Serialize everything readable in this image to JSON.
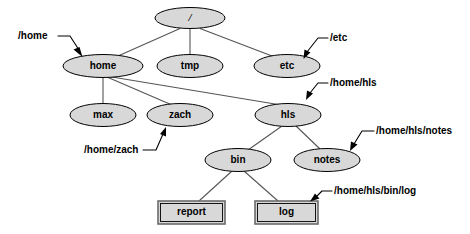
{
  "diagram": {
    "type": "filesystem-tree",
    "nodes": [
      {
        "id": "root",
        "label": "/",
        "shape": "ellipse",
        "cx": 190,
        "cy": 18,
        "rx": 35,
        "ry": 10.5
      },
      {
        "id": "home",
        "label": "home",
        "shape": "ellipse",
        "cx": 103,
        "cy": 66,
        "rx": 40,
        "ry": 11.5
      },
      {
        "id": "tmp",
        "label": "tmp",
        "shape": "ellipse",
        "cx": 190,
        "cy": 66,
        "rx": 33,
        "ry": 11.5
      },
      {
        "id": "etc",
        "label": "etc",
        "shape": "ellipse",
        "cx": 287,
        "cy": 66,
        "rx": 33,
        "ry": 11.5
      },
      {
        "id": "max",
        "label": "max",
        "shape": "ellipse",
        "cx": 103,
        "cy": 115,
        "rx": 33,
        "ry": 11.5
      },
      {
        "id": "zach",
        "label": "zach",
        "shape": "ellipse",
        "cx": 180,
        "cy": 115,
        "rx": 33,
        "ry": 11.5
      },
      {
        "id": "hls",
        "label": "hls",
        "shape": "ellipse",
        "cx": 288,
        "cy": 115,
        "rx": 33,
        "ry": 11.5
      },
      {
        "id": "bin",
        "label": "bin",
        "shape": "ellipse",
        "cx": 238,
        "cy": 160,
        "rx": 33,
        "ry": 11.5
      },
      {
        "id": "notes",
        "label": "notes",
        "shape": "ellipse",
        "cx": 327,
        "cy": 160,
        "rx": 33,
        "ry": 11.5
      },
      {
        "id": "report",
        "label": "report",
        "shape": "rect",
        "x": 158,
        "y": 201,
        "w": 67,
        "h": 23
      },
      {
        "id": "log",
        "label": "log",
        "shape": "rect",
        "x": 255,
        "y": 201,
        "w": 63,
        "h": 23
      }
    ],
    "edges": [
      {
        "from": "root",
        "to": "home"
      },
      {
        "from": "root",
        "to": "tmp"
      },
      {
        "from": "root",
        "to": "etc"
      },
      {
        "from": "home",
        "to": "max"
      },
      {
        "from": "home",
        "to": "zach"
      },
      {
        "from": "home",
        "to": "hls"
      },
      {
        "from": "hls",
        "to": "bin"
      },
      {
        "from": "hls",
        "to": "notes"
      },
      {
        "from": "bin",
        "to": "report"
      },
      {
        "from": "bin",
        "to": "log"
      }
    ],
    "callouts": [
      {
        "id": "callout-home",
        "text": "/home",
        "target": "home",
        "text_x": 18,
        "text_y": 36
      },
      {
        "id": "callout-etc",
        "text": "/etc",
        "target": "etc",
        "text_x": 330,
        "text_y": 38
      },
      {
        "id": "callout-home-hls",
        "text": "/home/hls",
        "target": "hls",
        "text_x": 330,
        "text_y": 83
      },
      {
        "id": "callout-home-zach",
        "text": "/home/zach",
        "target": "zach",
        "text_x": 84,
        "text_y": 150
      },
      {
        "id": "callout-hls-notes",
        "text": "/home/hls/notes",
        "target": "notes",
        "text_x": 376,
        "text_y": 131
      },
      {
        "id": "callout-bin-log",
        "text": "/home/hls/bin/log",
        "target": "log",
        "text_x": 334,
        "text_y": 191
      }
    ],
    "colors": {
      "node_fill": "#d8d8d8",
      "node_stroke": "#000000",
      "edge_stroke": "#555555",
      "rect_stroke": "#6b6b6b",
      "background": "#ffffff",
      "text": "#000000"
    }
  }
}
